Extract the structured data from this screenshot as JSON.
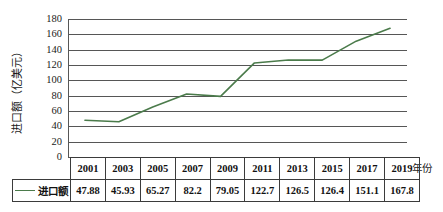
{
  "chart_data": {
    "type": "line",
    "title": "",
    "xlabel": "年份",
    "ylabel": "进口额（亿美元）",
    "categories": [
      "2001",
      "2003",
      "2005",
      "2007",
      "2009",
      "2011",
      "2013",
      "2015",
      "2017",
      "2019"
    ],
    "values": [
      47.88,
      45.93,
      65.27,
      82.2,
      79.05,
      122.7,
      126.5,
      126.4,
      151.1,
      167.8
    ],
    "value_labels": [
      "47.88",
      "45.93",
      "65.27",
      "82.2",
      "79.05",
      "122.7",
      "126.5",
      "126.4",
      "151.1",
      "167.8"
    ],
    "series": [
      {
        "name": "进口额",
        "values": [
          47.88,
          45.93,
          65.27,
          82.2,
          79.05,
          122.7,
          126.5,
          126.4,
          151.1,
          167.8
        ],
        "color": "#4b7b4b"
      }
    ],
    "ylim": [
      0,
      180
    ],
    "ytick_step": 20,
    "yticks": [
      "180",
      "160",
      "140",
      "120",
      "100",
      "80",
      "60",
      "40",
      "20",
      "0"
    ],
    "grid": true,
    "legend_position": "bottom-left-table",
    "legend_entries": [
      "进口额"
    ]
  },
  "table": {
    "header_row": [
      "2001",
      "2003",
      "2005",
      "2007",
      "2009",
      "2011",
      "2013",
      "2015",
      "2017",
      "2019"
    ],
    "data_row_label": "进口额",
    "data_row": [
      "47.88",
      "45.93",
      "65.27",
      "82.2",
      "79.05",
      "122.7",
      "126.5",
      "126.4",
      "151.1",
      "167.8"
    ]
  },
  "axes": {
    "x_title": "年份",
    "y_title": "进口额（亿美元）"
  },
  "colors": {
    "series_line": "#4b7b4b",
    "gridline": "#565656",
    "table_border": "#3b3b3b",
    "text": "#111111",
    "background": "#ffffff"
  }
}
